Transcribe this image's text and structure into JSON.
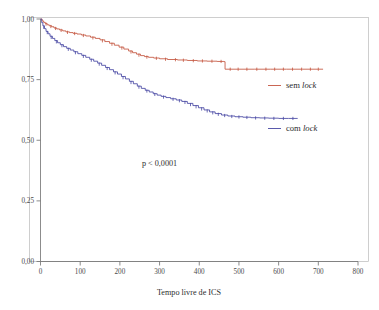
{
  "chart_data": {
    "type": "line",
    "subtype": "kaplan-meier-survival",
    "title": "",
    "xlabel": "Tempo livre de ICS",
    "ylabel": "",
    "xlim": [
      0,
      800
    ],
    "ylim": [
      0,
      1
    ],
    "xticks": [
      0,
      100,
      200,
      300,
      400,
      500,
      600,
      700,
      800
    ],
    "xticklabels": [
      "0",
      "100",
      "200",
      "300",
      "400",
      "500",
      "600",
      "700",
      "800"
    ],
    "yticks": [
      0,
      0.25,
      0.5,
      0.75,
      1
    ],
    "yticklabels": [
      "0,00",
      "0,25",
      "0,50",
      "0,75",
      "1,00"
    ],
    "grid": false,
    "legend_position": "inside-right",
    "annotations": [
      {
        "name": "p-value",
        "text": "p < 0,0001",
        "x": 300,
        "y": 0.395
      }
    ],
    "series": [
      {
        "name": "sem lock",
        "label_prefix": "sem ",
        "label_italic": "lock",
        "color": "#c4553f",
        "points": [
          [
            0,
            1.0
          ],
          [
            4,
            0.992
          ],
          [
            8,
            0.986
          ],
          [
            12,
            0.981
          ],
          [
            17,
            0.976
          ],
          [
            22,
            0.972
          ],
          [
            28,
            0.968
          ],
          [
            34,
            0.963
          ],
          [
            41,
            0.959
          ],
          [
            48,
            0.955
          ],
          [
            56,
            0.951
          ],
          [
            64,
            0.947
          ],
          [
            73,
            0.944
          ],
          [
            82,
            0.941
          ],
          [
            92,
            0.938
          ],
          [
            103,
            0.934
          ],
          [
            114,
            0.93
          ],
          [
            126,
            0.925
          ],
          [
            138,
            0.92
          ],
          [
            150,
            0.914
          ],
          [
            162,
            0.907
          ],
          [
            174,
            0.9
          ],
          [
            186,
            0.892
          ],
          [
            198,
            0.884
          ],
          [
            210,
            0.876
          ],
          [
            222,
            0.868
          ],
          [
            232,
            0.861
          ],
          [
            242,
            0.855
          ],
          [
            252,
            0.849
          ],
          [
            262,
            0.845
          ],
          [
            272,
            0.842
          ],
          [
            285,
            0.839
          ],
          [
            300,
            0.836
          ],
          [
            320,
            0.833
          ],
          [
            345,
            0.831
          ],
          [
            370,
            0.829
          ],
          [
            395,
            0.827
          ],
          [
            420,
            0.826
          ],
          [
            445,
            0.825
          ],
          [
            462,
            0.824
          ],
          [
            465,
            0.793
          ],
          [
            500,
            0.793
          ],
          [
            540,
            0.793
          ],
          [
            580,
            0.793
          ],
          [
            620,
            0.793
          ],
          [
            660,
            0.793
          ],
          [
            700,
            0.793
          ],
          [
            712,
            0.793
          ]
        ],
        "censored": [
          [
            14,
            0.979
          ],
          [
            26,
            0.969
          ],
          [
            38,
            0.961
          ],
          [
            52,
            0.953
          ],
          [
            68,
            0.945
          ],
          [
            86,
            0.94
          ],
          [
            108,
            0.932
          ],
          [
            132,
            0.922
          ],
          [
            156,
            0.91
          ],
          [
            180,
            0.896
          ],
          [
            205,
            0.88
          ],
          [
            228,
            0.864
          ],
          [
            248,
            0.851
          ],
          [
            268,
            0.843
          ],
          [
            292,
            0.838
          ],
          [
            315,
            0.834
          ],
          [
            340,
            0.832
          ],
          [
            360,
            0.83
          ],
          [
            385,
            0.828
          ],
          [
            408,
            0.827
          ],
          [
            432,
            0.826
          ],
          [
            455,
            0.825
          ],
          [
            478,
            0.793
          ],
          [
            498,
            0.793
          ],
          [
            520,
            0.793
          ],
          [
            545,
            0.793
          ],
          [
            568,
            0.793
          ],
          [
            590,
            0.793
          ],
          [
            612,
            0.793
          ],
          [
            635,
            0.793
          ],
          [
            658,
            0.793
          ],
          [
            680,
            0.793
          ],
          [
            700,
            0.793
          ]
        ]
      },
      {
        "name": "com lock",
        "label_prefix": "com ",
        "label_italic": "lock",
        "color": "#4747a3",
        "points": [
          [
            0,
            1.0
          ],
          [
            3,
            0.985
          ],
          [
            6,
            0.972
          ],
          [
            10,
            0.96
          ],
          [
            14,
            0.949
          ],
          [
            19,
            0.939
          ],
          [
            24,
            0.929
          ],
          [
            30,
            0.92
          ],
          [
            36,
            0.911
          ],
          [
            43,
            0.902
          ],
          [
            50,
            0.894
          ],
          [
            58,
            0.886
          ],
          [
            66,
            0.879
          ],
          [
            75,
            0.872
          ],
          [
            84,
            0.865
          ],
          [
            94,
            0.857
          ],
          [
            104,
            0.85
          ],
          [
            114,
            0.842
          ],
          [
            124,
            0.834
          ],
          [
            134,
            0.826
          ],
          [
            144,
            0.818
          ],
          [
            154,
            0.809
          ],
          [
            164,
            0.8
          ],
          [
            174,
            0.791
          ],
          [
            184,
            0.782
          ],
          [
            194,
            0.773
          ],
          [
            204,
            0.763
          ],
          [
            214,
            0.753
          ],
          [
            224,
            0.743
          ],
          [
            234,
            0.733
          ],
          [
            244,
            0.723
          ],
          [
            254,
            0.714
          ],
          [
            264,
            0.706
          ],
          [
            274,
            0.699
          ],
          [
            284,
            0.692
          ],
          [
            294,
            0.686
          ],
          [
            304,
            0.681
          ],
          [
            316,
            0.676
          ],
          [
            328,
            0.671
          ],
          [
            342,
            0.666
          ],
          [
            356,
            0.66
          ],
          [
            370,
            0.652
          ],
          [
            384,
            0.643
          ],
          [
            398,
            0.634
          ],
          [
            412,
            0.625
          ],
          [
            426,
            0.617
          ],
          [
            440,
            0.61
          ],
          [
            456,
            0.604
          ],
          [
            472,
            0.6
          ],
          [
            490,
            0.597
          ],
          [
            510,
            0.595
          ],
          [
            530,
            0.593
          ],
          [
            552,
            0.592
          ],
          [
            575,
            0.591
          ],
          [
            600,
            0.59
          ],
          [
            625,
            0.59
          ],
          [
            648,
            0.59
          ]
        ],
        "censored": [
          [
            8,
            0.966
          ],
          [
            17,
            0.944
          ],
          [
            27,
            0.924
          ],
          [
            40,
            0.906
          ],
          [
            54,
            0.89
          ],
          [
            70,
            0.875
          ],
          [
            88,
            0.861
          ],
          [
            108,
            0.846
          ],
          [
            128,
            0.83
          ],
          [
            148,
            0.814
          ],
          [
            168,
            0.796
          ],
          [
            188,
            0.778
          ],
          [
            208,
            0.758
          ],
          [
            228,
            0.738
          ],
          [
            248,
            0.719
          ],
          [
            268,
            0.703
          ],
          [
            288,
            0.689
          ],
          [
            310,
            0.678
          ],
          [
            334,
            0.669
          ],
          [
            350,
            0.663
          ],
          [
            364,
            0.656
          ],
          [
            378,
            0.647
          ],
          [
            392,
            0.638
          ],
          [
            406,
            0.629
          ],
          [
            420,
            0.621
          ],
          [
            434,
            0.613
          ],
          [
            448,
            0.607
          ],
          [
            464,
            0.602
          ],
          [
            482,
            0.598
          ],
          [
            500,
            0.596
          ],
          [
            520,
            0.594
          ],
          [
            542,
            0.592
          ],
          [
            565,
            0.591
          ],
          [
            588,
            0.59
          ],
          [
            612,
            0.59
          ],
          [
            636,
            0.59
          ]
        ]
      }
    ]
  },
  "axes": {
    "x_title": "Tempo livre de ICS",
    "x_tick_labels": [
      "0",
      "100",
      "200",
      "300",
      "400",
      "500",
      "600",
      "700",
      "800"
    ],
    "y_tick_labels": [
      "0,00",
      "0,25",
      "0,50",
      "0,75",
      "1,00"
    ]
  },
  "legend": {
    "items": [
      {
        "label_prefix": "sem ",
        "label_italic": "lock",
        "color": "#c4553f"
      },
      {
        "label_prefix": "com ",
        "label_italic": "lock",
        "color": "#4747a3"
      }
    ]
  },
  "statistics": {
    "p_value_text": "p < 0,0001"
  },
  "colors": {
    "series_sem_lock": "#c4553f",
    "series_com_lock": "#4747a3",
    "frame": "#b9b9b9",
    "axis": "#6f6f6f",
    "text": "#2e2e2e",
    "background": "#ffffff"
  }
}
